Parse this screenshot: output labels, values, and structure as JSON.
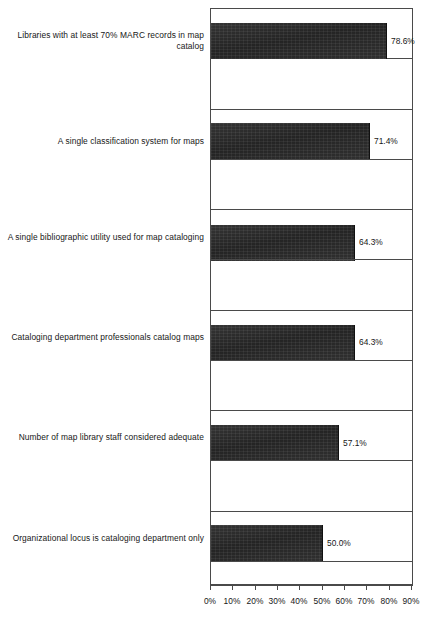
{
  "chart_data": {
    "type": "bar",
    "orientation": "horizontal",
    "title": "",
    "subtitle": "",
    "xlabel": "",
    "ylabel": "",
    "xlim": [
      0,
      90
    ],
    "grid": false,
    "legend": null,
    "value_suffix": "%",
    "categories": [
      "Libraries with at least 70% MARC records in map catalog",
      "A single classification system for maps",
      "A single bibliographic utility used for map cataloging",
      "Cataloging department professionals catalog maps",
      "Number of map library staff considered adequate",
      "Organizational locus is cataloging department only",
      "Physical location is cataloging department only",
      "Cataloging department paraprofessionals catalog maps",
      "Staff need for map cataloging ranked #1",
      "Map library professionals catalog maps",
      "More than one bibliographic utility used for map cataloging"
    ],
    "values": [
      78.6,
      71.4,
      64.3,
      64.3,
      57.1,
      50.0,
      42.9,
      42.9,
      35.7,
      35.7,
      35.7
    ],
    "value_labels": [
      "78.6%",
      "71.4%",
      "64.3%",
      "64.3%",
      "57.1%",
      "50.0%",
      "42.9%",
      "42.9%",
      "35.7%",
      "35.7%",
      "35.7%"
    ],
    "xticks": [
      0,
      10,
      20,
      30,
      40,
      50,
      60,
      70,
      80,
      90
    ],
    "xtick_labels": [
      "0%",
      "10%",
      "20%",
      "30%",
      "40%",
      "50%",
      "60%",
      "70%",
      "80%",
      "90%"
    ],
    "bar_color": "#2b2b2b",
    "frame_color": "#4a4a4a",
    "background_color": "#ffffff"
  }
}
